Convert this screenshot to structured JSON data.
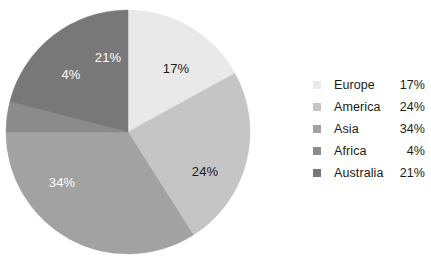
{
  "chart_data": {
    "type": "pie",
    "title": "",
    "subtitle": "",
    "xlabel": "",
    "ylabel": "",
    "grid": false,
    "legend_position": "right",
    "start_angle_deg": 0,
    "direction": "clockwise",
    "categories": [
      "Europe",
      "America",
      "Asia",
      "Africa",
      "Australia"
    ],
    "values": [
      17,
      24,
      34,
      4,
      21
    ],
    "value_unit": "%",
    "slices": [
      {
        "label": "Europe",
        "value": 17,
        "value_text": "17%",
        "color": "#e9e9e9",
        "label_color": "#1a1a1a",
        "label_x": 176,
        "label_y": 68
      },
      {
        "label": "America",
        "value": 24,
        "value_text": "24%",
        "color": "#c5c5c5",
        "label_color": "#1a1a1a",
        "label_x": 205,
        "label_y": 171
      },
      {
        "label": "Asia",
        "value": 34,
        "value_text": "34%",
        "color": "#a2a2a2",
        "label_color": "#ffffff",
        "label_x": 62,
        "label_y": 182
      },
      {
        "label": "Africa",
        "value": 4,
        "value_text": "4%",
        "color": "#8b8b8b",
        "label_color": "#ffffff",
        "label_x": 71,
        "label_y": 74
      },
      {
        "label": "Australia",
        "value": 21,
        "value_text": "21%",
        "color": "#787878",
        "label_color": "#ffffff",
        "label_x": 108,
        "label_y": 57
      }
    ],
    "geometry": {
      "center_x": 128,
      "center_y": 132,
      "radius": 122
    },
    "background_color": "#ffffff"
  },
  "legend": {
    "rows": [
      {
        "name": "Europe",
        "value": "17%",
        "color": "#e9e9e9"
      },
      {
        "name": "America",
        "value": "24%",
        "color": "#c5c5c5"
      },
      {
        "name": "Asia",
        "value": "34%",
        "color": "#a2a2a2"
      },
      {
        "name": "Africa",
        "value": "4%",
        "color": "#8b8b8b"
      },
      {
        "name": "Australia",
        "value": "21%",
        "color": "#787878"
      }
    ]
  }
}
